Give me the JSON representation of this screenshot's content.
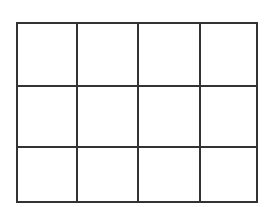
{
  "grid": {
    "rows": 3,
    "columns": 4,
    "line_color": "#333333",
    "background_color": "#ffffff",
    "cells": [
      [
        "",
        "",
        "",
        ""
      ],
      [
        "",
        "",
        "",
        ""
      ],
      [
        "",
        "",
        "",
        ""
      ]
    ]
  }
}
